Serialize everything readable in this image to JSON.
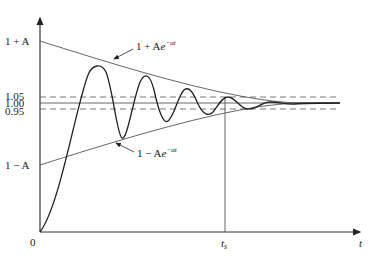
{
  "diagram": {
    "y_labels": {
      "upper": "1 + A",
      "v105": "1.05",
      "v100": "1.00",
      "v095": "0.95",
      "lower": "1 − A",
      "origin": "0"
    },
    "x_labels": {
      "ts": "t",
      "ts_sub": "s",
      "t": "t"
    },
    "annotations": {
      "upper_envelope": {
        "prefix": "1 + A",
        "e": "e",
        "exp": "−αt"
      },
      "lower_envelope": {
        "prefix": "1 − A",
        "e": "e",
        "exp": "−αt"
      }
    },
    "colors": {
      "line": "#333333",
      "text": "#222222",
      "background": "#ffffff"
    }
  }
}
